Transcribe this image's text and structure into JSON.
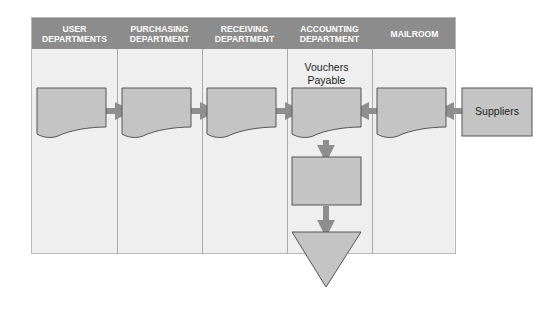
{
  "diagram": {
    "type": "swimlane-flowchart",
    "lanes": [
      {
        "id": "user-departments",
        "line1": "USER",
        "line2": "DEPARTMENTS"
      },
      {
        "id": "purchasing-department",
        "line1": "PURCHASING",
        "line2": "DEPARTMENT"
      },
      {
        "id": "receiving-department",
        "line1": "RECEIVING",
        "line2": "DEPARTMENT"
      },
      {
        "id": "accounting-department",
        "line1": "ACCOUNTING",
        "line2": "DEPARTMENT"
      },
      {
        "id": "mailroom",
        "line1": "MAILROOM",
        "line2": ""
      }
    ],
    "labels": {
      "vouchers_line1": "Vouchers",
      "vouchers_line2": "Payable",
      "suppliers": "Suppliers"
    },
    "nodes": [
      {
        "id": "doc-user",
        "shape": "document",
        "lane": "user-departments"
      },
      {
        "id": "doc-purchasing",
        "shape": "document",
        "lane": "purchasing-department"
      },
      {
        "id": "doc-receiving",
        "shape": "document",
        "lane": "receiving-department"
      },
      {
        "id": "doc-vouchers",
        "shape": "document",
        "lane": "accounting-department",
        "label": "Vouchers Payable"
      },
      {
        "id": "doc-mailroom",
        "shape": "document",
        "lane": "mailroom"
      },
      {
        "id": "suppliers",
        "shape": "rectangle",
        "lane": "external",
        "label": "Suppliers"
      },
      {
        "id": "process-accounting",
        "shape": "rectangle",
        "lane": "accounting-department"
      },
      {
        "id": "file-accounting",
        "shape": "triangle-down",
        "lane": "accounting-department"
      }
    ],
    "edges": [
      {
        "from": "doc-user",
        "to": "doc-purchasing"
      },
      {
        "from": "doc-purchasing",
        "to": "doc-receiving"
      },
      {
        "from": "doc-receiving",
        "to": "doc-vouchers"
      },
      {
        "from": "suppliers",
        "to": "doc-mailroom"
      },
      {
        "from": "doc-mailroom",
        "to": "doc-vouchers"
      },
      {
        "from": "doc-vouchers",
        "to": "process-accounting"
      },
      {
        "from": "process-accounting",
        "to": "file-accounting"
      }
    ],
    "colors": {
      "header_bg": "#8c8c8c",
      "header_text": "#ffffff",
      "lane_bg": "#efefef",
      "shape_fill": "#c4c4c4",
      "shape_stroke": "#555555",
      "arrow": "#8e8e8e"
    }
  }
}
